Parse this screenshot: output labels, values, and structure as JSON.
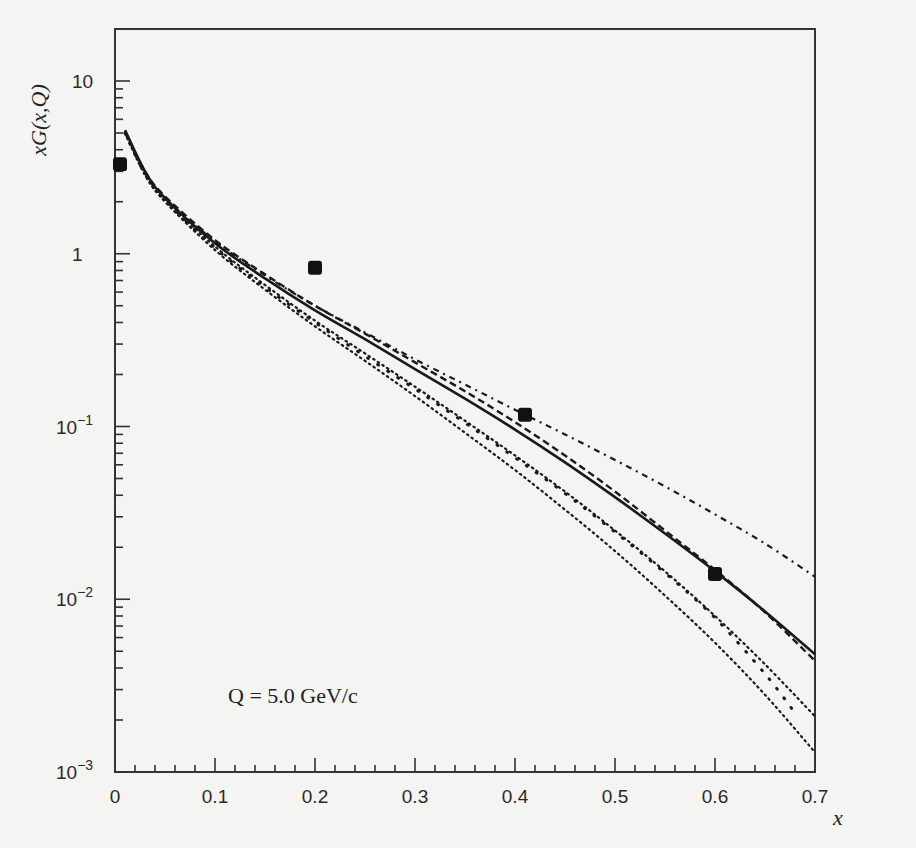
{
  "chart_data": {
    "type": "line",
    "title": "",
    "xlabel": "x",
    "ylabel": "xG(x,Q)",
    "yscale": "log",
    "xlim": [
      0,
      0.7
    ],
    "ylim": [
      0.001,
      20
    ],
    "grid": false,
    "legend": null,
    "annotation": "Q = 5.0 GeV/c",
    "x_ticks": [
      "0",
      "0.1",
      "0.2",
      "0.3",
      "0.4",
      "0.5",
      "0.6",
      "0.7"
    ],
    "y_ticks": [
      "10",
      "1",
      "10^-1",
      "10^-2",
      "10^-3"
    ],
    "y_tick_labels": [
      {
        "base": "10",
        "exp": ""
      },
      {
        "base": "1",
        "exp": ""
      },
      {
        "base": "10",
        "exp": "−1"
      },
      {
        "base": "10",
        "exp": "−2"
      },
      {
        "base": "10",
        "exp": "−3"
      }
    ],
    "data_points": {
      "name": "data",
      "x": [
        0.005,
        0.2,
        0.41,
        0.6
      ],
      "y": [
        3.3,
        0.83,
        0.117,
        0.014
      ]
    },
    "series": [
      {
        "name": "solid",
        "style": "solid",
        "x": [
          0.01,
          0.03,
          0.05,
          0.1,
          0.15,
          0.2,
          0.25,
          0.3,
          0.35,
          0.4,
          0.45,
          0.5,
          0.55,
          0.6,
          0.65,
          0.7
        ],
        "y": [
          5.2,
          3.0,
          2.1,
          1.15,
          0.72,
          0.47,
          0.32,
          0.215,
          0.145,
          0.096,
          0.062,
          0.039,
          0.024,
          0.0145,
          0.0085,
          0.0048
        ]
      },
      {
        "name": "dashed",
        "style": "dashed",
        "x": [
          0.01,
          0.03,
          0.05,
          0.1,
          0.15,
          0.2,
          0.25,
          0.3,
          0.35,
          0.4,
          0.45,
          0.5,
          0.55,
          0.6,
          0.65,
          0.7
        ],
        "y": [
          5.1,
          3.0,
          2.15,
          1.2,
          0.76,
          0.5,
          0.345,
          0.235,
          0.16,
          0.106,
          0.068,
          0.042,
          0.025,
          0.0148,
          0.0084,
          0.0044
        ]
      },
      {
        "name": "dash-dot",
        "style": "dashdot",
        "x": [
          0.01,
          0.03,
          0.05,
          0.1,
          0.15,
          0.2,
          0.25,
          0.3,
          0.35,
          0.4,
          0.45,
          0.5,
          0.55,
          0.6,
          0.65,
          0.7
        ],
        "y": [
          5.0,
          2.95,
          2.1,
          1.18,
          0.75,
          0.5,
          0.35,
          0.245,
          0.175,
          0.125,
          0.09,
          0.064,
          0.045,
          0.031,
          0.021,
          0.0135
        ]
      },
      {
        "name": "dotted-1",
        "style": "dotted",
        "x": [
          0.01,
          0.03,
          0.05,
          0.1,
          0.15,
          0.2,
          0.25,
          0.3,
          0.35,
          0.4,
          0.45,
          0.5,
          0.55,
          0.6,
          0.65,
          0.7
        ],
        "y": [
          5.0,
          2.9,
          2.05,
          1.1,
          0.66,
          0.41,
          0.265,
          0.17,
          0.108,
          0.068,
          0.042,
          0.025,
          0.0145,
          0.008,
          0.0042,
          0.0021
        ]
      },
      {
        "name": "dotted-2",
        "style": "dotted",
        "x": [
          0.01,
          0.03,
          0.05,
          0.1,
          0.15,
          0.2,
          0.25,
          0.3,
          0.35,
          0.4,
          0.45,
          0.5,
          0.55,
          0.6,
          0.65,
          0.7
        ],
        "y": [
          5.0,
          2.85,
          2.0,
          1.05,
          0.62,
          0.38,
          0.24,
          0.15,
          0.092,
          0.056,
          0.033,
          0.019,
          0.0105,
          0.0056,
          0.0028,
          0.0013
        ]
      },
      {
        "name": "sparse-dotted",
        "style": "sparse",
        "x": [
          0.01,
          0.03,
          0.05,
          0.1,
          0.15,
          0.2,
          0.25,
          0.3,
          0.35,
          0.4,
          0.45,
          0.5,
          0.55,
          0.6,
          0.65,
          0.68
        ],
        "y": [
          5.0,
          2.9,
          2.05,
          1.08,
          0.64,
          0.4,
          0.255,
          0.165,
          0.105,
          0.066,
          0.041,
          0.0245,
          0.0142,
          0.0078,
          0.0037,
          0.0022
        ]
      }
    ]
  }
}
